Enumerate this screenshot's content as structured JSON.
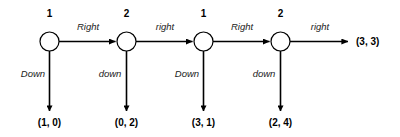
{
  "figure": {
    "type": "extensive-form-game-tree",
    "background_color": "#ffffff",
    "line_color": "#000000",
    "terminal_payoff": "(3, 3)"
  },
  "nodes": [
    {
      "id": "node-1",
      "player_label": "1",
      "cx": 49.5,
      "cy": 41.5,
      "r": 9.5,
      "across_action": "Right",
      "down_action": "Down",
      "down_payoff": "(1, 0)"
    },
    {
      "id": "node-2",
      "player_label": "2",
      "cx": 126.5,
      "cy": 41.5,
      "r": 9.5,
      "across_action": "right",
      "down_action": "down",
      "down_payoff": "(0, 2)"
    },
    {
      "id": "node-3",
      "player_label": "1",
      "cx": 203.5,
      "cy": 41.5,
      "r": 9.5,
      "across_action": "Right",
      "down_action": "Down",
      "down_payoff": "(3, 1)"
    },
    {
      "id": "node-4",
      "player_label": "2",
      "cx": 280.5,
      "cy": 41.5,
      "r": 9.5,
      "across_action": "right",
      "down_action": "down",
      "down_payoff": "(2, 4)"
    }
  ],
  "geometry": {
    "player_label_y": 17,
    "action_label_y": 30,
    "down_label_y": 77,
    "payoff_label_y": 126,
    "down_arrow_tip_y": 111,
    "down_label_offset_x": -7,
    "terminal_arrow_end_x": 348,
    "terminal_label_x": 356
  }
}
